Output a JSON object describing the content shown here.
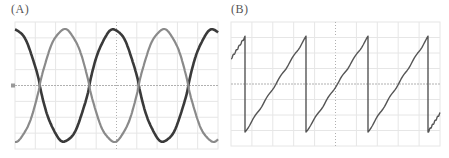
{
  "panels": {
    "a": {
      "label": "(A)"
    },
    "b": {
      "label": "(B)"
    }
  },
  "colors": {
    "trace_dark": "#3a3a3a",
    "trace_light": "#8a8a8a",
    "trace_saw": "#555555",
    "grid": "#e6e6e6",
    "axis": "#b0b0b0"
  },
  "chart_data": [
    {
      "type": "line",
      "title": "(A)",
      "xlabel": "",
      "ylabel": "",
      "grid": true,
      "legend": null,
      "xlim": [
        0,
        2.5
      ],
      "ylim": [
        -1.2,
        1.2
      ],
      "x_divisions": 10,
      "y_divisions": 8,
      "series": [
        {
          "name": "dark sinusoid",
          "shape": "sine",
          "amplitude": 1.0,
          "periods_visible": 2.05,
          "phase_deg": 90,
          "color": "#3a3a3a"
        },
        {
          "name": "light sinusoid",
          "shape": "sine",
          "amplitude": 1.0,
          "periods_visible": 2.05,
          "phase_deg": -90,
          "color": "#8a8a8a"
        }
      ]
    },
    {
      "type": "line",
      "title": "(B)",
      "xlabel": "",
      "ylabel": "",
      "grid": true,
      "legend": null,
      "xlim": [
        0,
        3.4
      ],
      "ylim": [
        -1.2,
        1.2
      ],
      "x_divisions": 10,
      "y_divisions": 8,
      "series": [
        {
          "name": "sawtooth",
          "shape": "sawtooth",
          "amplitude": 1.0,
          "periods_visible": 3.4,
          "reset_x_px": [
            245,
            306,
            368,
            428
          ],
          "color": "#555555"
        }
      ]
    }
  ]
}
